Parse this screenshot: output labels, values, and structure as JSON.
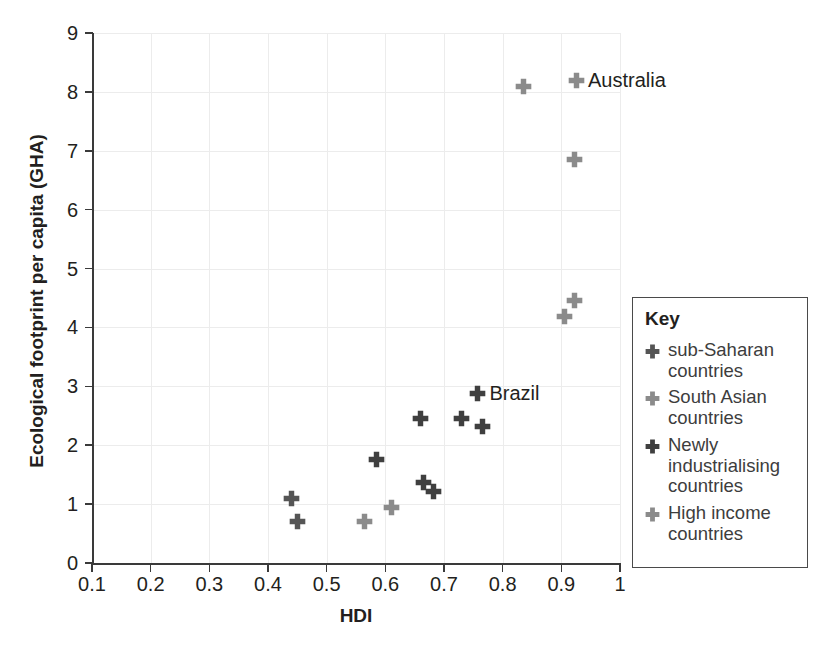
{
  "chart_data": {
    "type": "scatter",
    "title": "",
    "xlabel": "HDI",
    "ylabel": "Ecological footprint per capita (GHA)",
    "xlim": [
      0.1,
      1.0
    ],
    "ylim": [
      0,
      9
    ],
    "xticks": [
      "0.1",
      "0.2",
      "0.3",
      "0.4",
      "0.5",
      "0.6",
      "0.7",
      "0.8",
      "0.9",
      "1"
    ],
    "yticks": [
      "0",
      "1",
      "2",
      "3",
      "4",
      "5",
      "6",
      "7",
      "8",
      "9"
    ],
    "grid": true,
    "legend_position": "right",
    "series": [
      {
        "name": "sub-Saharan countries",
        "color": "#555555",
        "marker": "plus",
        "points": [
          {
            "x": 0.44,
            "y": 1.1
          },
          {
            "x": 0.45,
            "y": 0.7
          }
        ]
      },
      {
        "name": "South Asian countries",
        "color": "#8b8b8b",
        "marker": "plus",
        "points": [
          {
            "x": 0.565,
            "y": 0.7
          },
          {
            "x": 0.61,
            "y": 0.95
          }
        ]
      },
      {
        "name": "Newly industrialising countries",
        "color": "#3f3f3f",
        "marker": "plus",
        "points": [
          {
            "x": 0.585,
            "y": 1.75
          },
          {
            "x": 0.66,
            "y": 2.45
          },
          {
            "x": 0.665,
            "y": 1.37
          },
          {
            "x": 0.682,
            "y": 1.22
          },
          {
            "x": 0.73,
            "y": 2.45
          },
          {
            "x": 0.765,
            "y": 2.32
          },
          {
            "x": 0.757,
            "y": 2.88,
            "label": "Brazil"
          }
        ]
      },
      {
        "name": "High income countries",
        "color": "#8b8b8b",
        "marker": "plus",
        "points": [
          {
            "x": 0.835,
            "y": 8.1
          },
          {
            "x": 0.925,
            "y": 8.2,
            "label": "Australia"
          },
          {
            "x": 0.922,
            "y": 6.85
          },
          {
            "x": 0.923,
            "y": 4.45
          },
          {
            "x": 0.905,
            "y": 4.18
          }
        ]
      }
    ],
    "annotations": [
      {
        "text": "Australia",
        "x": 0.925,
        "y": 8.2
      },
      {
        "text": "Brazil",
        "x": 0.757,
        "y": 2.88
      }
    ]
  },
  "legend": {
    "title": "Key",
    "items": [
      {
        "label": "sub-Saharan countries",
        "color": "#555555"
      },
      {
        "label": "South Asian countries",
        "color": "#8b8b8b"
      },
      {
        "label": "Newly industrialising countries",
        "color": "#3f3f3f"
      },
      {
        "label": "High income countries",
        "color": "#8b8b8b"
      }
    ]
  },
  "colors": {
    "axis": "#3a3a3a",
    "grid": "#ececec",
    "text": "#231f20",
    "background": "#ffffff"
  }
}
